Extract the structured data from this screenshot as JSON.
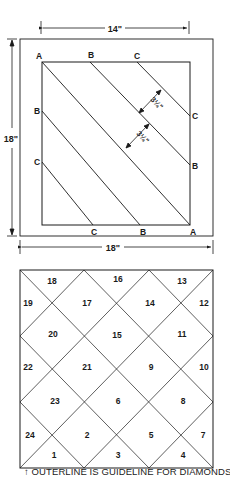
{
  "top_diagram": {
    "dimensions": {
      "inner_width": "14\"",
      "outer_height": "18\"",
      "outer_width": "18\""
    },
    "corner_labels": {
      "top": [
        "A",
        "B",
        "C"
      ],
      "left": [
        "B",
        "C"
      ],
      "right": [
        "C",
        "B"
      ],
      "bottom": [
        "C",
        "B",
        "A"
      ]
    },
    "strip_width_labels": [
      "3¼\"",
      "3¼\""
    ]
  },
  "bottom_diagram": {
    "pieces": [
      {
        "n": "18"
      },
      {
        "n": "16"
      },
      {
        "n": "13"
      },
      {
        "n": "19"
      },
      {
        "n": "17"
      },
      {
        "n": "14"
      },
      {
        "n": "12"
      },
      {
        "n": "20"
      },
      {
        "n": "15"
      },
      {
        "n": "11"
      },
      {
        "n": "22"
      },
      {
        "n": "21"
      },
      {
        "n": "9"
      },
      {
        "n": "10"
      },
      {
        "n": "23"
      },
      {
        "n": "6"
      },
      {
        "n": "8"
      },
      {
        "n": "24"
      },
      {
        "n": "2"
      },
      {
        "n": "5"
      },
      {
        "n": "7"
      },
      {
        "n": "1"
      },
      {
        "n": "3"
      },
      {
        "n": "4"
      }
    ],
    "caption_marker": "↑",
    "caption": "OUTERLINE IS GUIDELINE FOR DIAMONDS"
  }
}
